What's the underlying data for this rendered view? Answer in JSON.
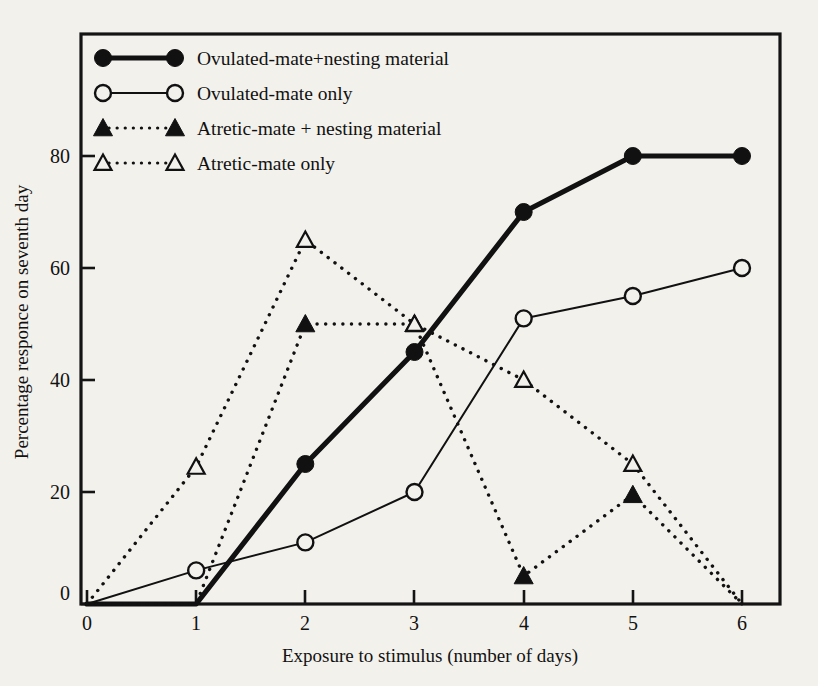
{
  "chart_data": {
    "type": "line",
    "title": "",
    "xlabel": "Exposure to stimulus (number of days)",
    "ylabel": "Percentage responce on seventh day",
    "x": [
      0,
      1,
      2,
      3,
      4,
      5,
      6
    ],
    "xlim": [
      0,
      6
    ],
    "ylim": [
      0,
      88
    ],
    "xticks": [
      "0",
      "1",
      "2",
      "3",
      "4",
      "5",
      "6"
    ],
    "yticks": [
      "0",
      "20",
      "40",
      "60",
      "80"
    ],
    "ytick_values": [
      0,
      20,
      40,
      60,
      80
    ],
    "grid": false,
    "legend_position": "top-left",
    "series": [
      {
        "name": "Ovulated-mate+nesting material",
        "marker": "filled-circle",
        "line_style": "solid",
        "line_width": "thick",
        "color": "#111111",
        "x": [
          0,
          1,
          2,
          3,
          4,
          5,
          6
        ],
        "values": [
          0,
          0,
          25,
          45,
          70,
          80,
          80
        ]
      },
      {
        "name": "Ovulated-mate only",
        "marker": "open-circle",
        "line_style": "solid",
        "line_width": "thin",
        "color": "#111111",
        "x": [
          0,
          1,
          2,
          3,
          4,
          5,
          6
        ],
        "values": [
          0,
          6,
          11,
          20,
          51,
          55,
          60
        ]
      },
      {
        "name": "Atretic-mate + nesting material",
        "marker": "filled-triangle",
        "line_style": "dotted",
        "line_width": "thin",
        "color": "#111111",
        "x": [
          0,
          1,
          2,
          3,
          4,
          5,
          6
        ],
        "values": [
          0,
          0,
          50,
          50,
          5,
          19.5,
          0
        ]
      },
      {
        "name": "Atretic-mate only",
        "marker": "open-triangle",
        "line_style": "dotted",
        "line_width": "thin",
        "color": "#111111",
        "x": [
          0,
          1,
          2,
          3,
          4,
          5,
          6
        ],
        "values": [
          0,
          24.5,
          65,
          50,
          40,
          25,
          0
        ]
      }
    ]
  },
  "legend": {
    "entries": [
      {
        "label": "Ovulated-mate+nesting material",
        "marker": "filled-circle",
        "line_style": "solid",
        "line_width": "thick"
      },
      {
        "label": "Ovulated-mate only",
        "marker": "open-circle",
        "line_style": "solid",
        "line_width": "thin"
      },
      {
        "label": "Atretic-mate + nesting material",
        "marker": "filled-triangle",
        "line_style": "dotted",
        "line_width": "thin"
      },
      {
        "label": "Atretic-mate only",
        "marker": "open-triangle",
        "line_style": "dotted",
        "line_width": "thin"
      }
    ]
  },
  "colors": {
    "ink": "#111111",
    "paper": "#f3f1ec",
    "frame": "#141414"
  }
}
